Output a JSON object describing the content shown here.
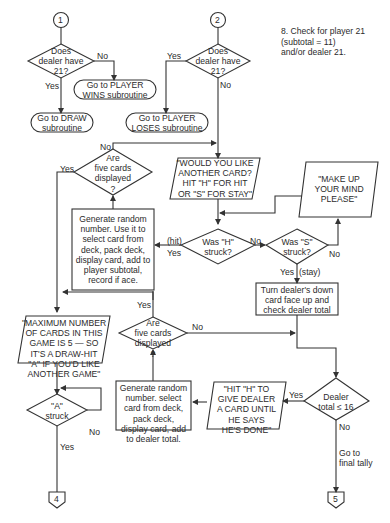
{
  "note": "8. Check for player 21\n   (subtotal = 11)\n   and/or dealer 21.",
  "connectors": {
    "c1": "1",
    "c2": "2",
    "c4": "4",
    "c5": "5"
  },
  "nodes": {
    "d1": "Does\ndealer have\n21?",
    "t_player_wins": "Go to PLAYER\nWINS subroutine",
    "t_draw": "Go to DRAW\nsubroutine",
    "d2": "Does\ndealer have\n21?",
    "t_player_loses": "Go to PLAYER\nLOSES subroutine",
    "d_five_player": "Are\nfive cards\ndisplayed\n?",
    "io_another_card": "\"WOULD YOU LIKE\nANOTHER CARD?\nHIT \"H\" FOR HIT\nOR \"S\" FOR STAY\"",
    "io_make_up_mind": "\"MAKE UP\nYOUR MIND\nPLEASE\"",
    "p_player_card": "Generate random\nnumber. Use it to\nselect card from\ndeck, pack deck,\ndisplay card, add to\nplayer subtotal,\nrecord if ace.",
    "d_h_struck": "Was \"H\"\nstruck?",
    "d_s_struck": "Was \"S\"\nstruck?",
    "p_turn_dealer": "Turn dealer's down\ncard face up and\ncheck dealer total",
    "io_max_cards": "\"MAXIMUM NUMBER\nOF CARDS IN THIS\nGAME IS 5 — SO\nIT'S A DRAW-HIT\n\"A\" IF YOU'D LIKE\nANOTHER GAME\"",
    "d_five_dealer": "Are\nfive cards\ndisplayed\n?",
    "p_dealer_card": "Generate random\nnumber. select\ncard from deck,\npack deck,\ndisplay card, add\nto dealer total.",
    "io_hit_dealer": "\"HIT \"H\" TO\nGIVE DEALER\nA CARD UNTIL\nHE SAYS\nHE'S DONE\"",
    "d_dealer_16": "Dealer\ntotal ≤ 16",
    "d_a_struck": "\"A\"\nstruck",
    "final_tally": "Go to\nfinal tally"
  },
  "edge_labels": {
    "d1_no": "No",
    "d1_yes": "Yes",
    "d2_yes": "Yes",
    "d2_no": "No",
    "five_player_no": "No",
    "five_player_yes": "Yes",
    "h_hit": "(hit)",
    "h_yes": "Yes",
    "h_no": "No",
    "s_no": "No",
    "s_yes": "Yes",
    "s_stay": "(stay)",
    "five_dealer_yes": "Yes",
    "five_dealer_no": "No",
    "dealer16_yes": "Yes",
    "dealer16_no": "No",
    "a_no": "No",
    "a_yes": "Yes"
  },
  "colors": {
    "line": "#333333",
    "background": "#ffffff"
  }
}
